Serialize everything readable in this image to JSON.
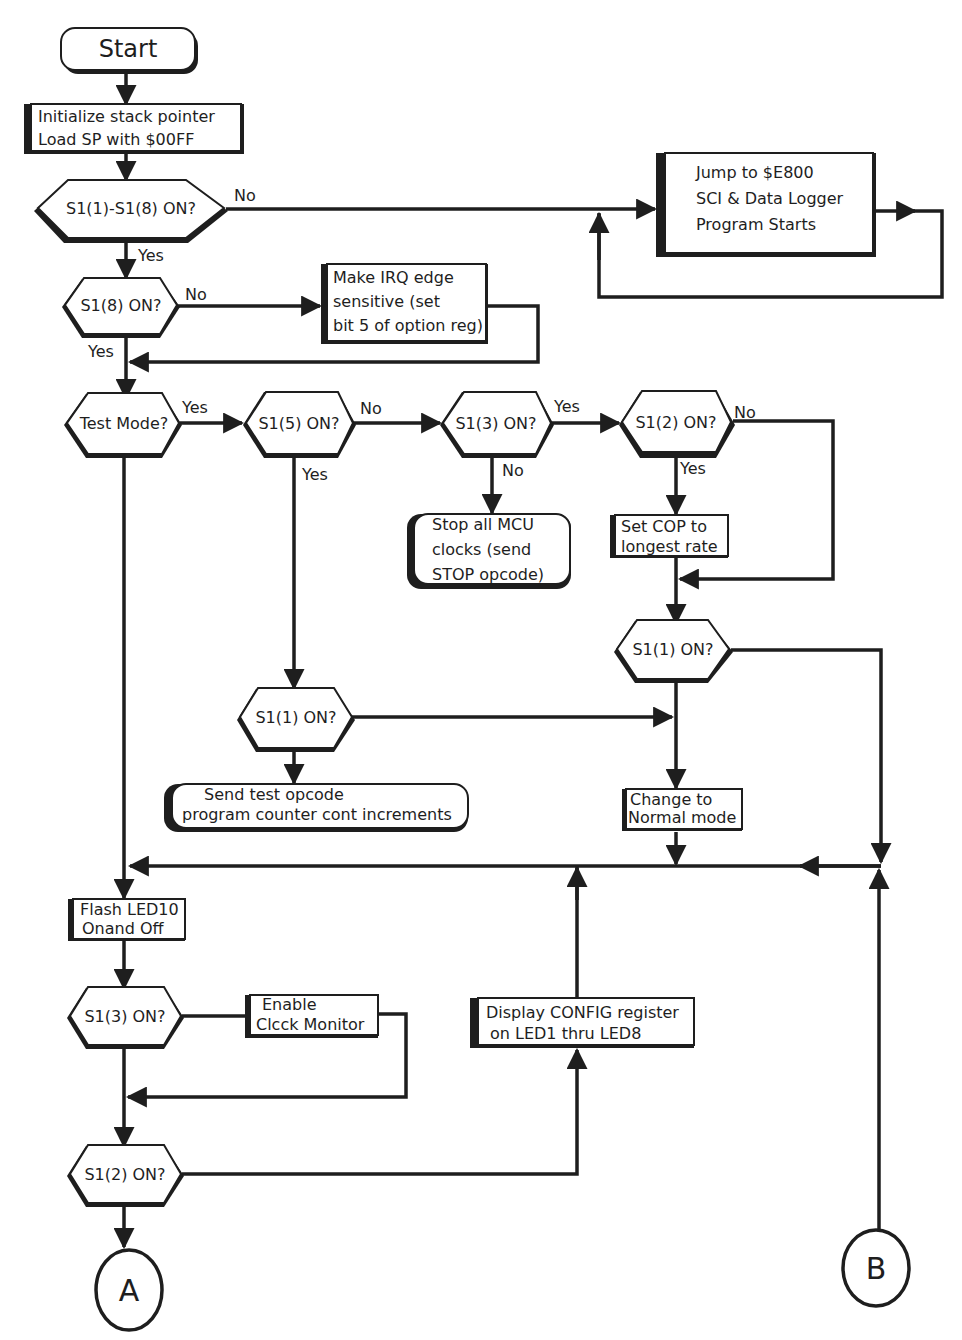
{
  "diagram": {
    "type": "flowchart",
    "colors": {
      "ink": "#1e1e1e",
      "background": "#ffffff"
    },
    "nodes": {
      "start": {
        "kind": "terminal",
        "label": "Start"
      },
      "init_sp": {
        "kind": "process",
        "lines": [
          "Initialize stack pointer",
          "Load SP with $00FF"
        ]
      },
      "dec_all": {
        "kind": "decision",
        "label": "S1(1)-S1(8) ON?"
      },
      "jump_e800": {
        "kind": "process",
        "lines": [
          "Jump to $E800",
          "SCI & Data Logger",
          "Program Starts"
        ]
      },
      "dec_s18": {
        "kind": "decision",
        "label": "S1(8) ON?"
      },
      "irq_edge": {
        "kind": "process",
        "lines": [
          "Make IRQ edge",
          "sensitive (set",
          "bit 5 of option reg)"
        ]
      },
      "dec_test": {
        "kind": "decision",
        "label": "Test Mode?"
      },
      "dec_s15": {
        "kind": "decision",
        "label": "S1(5) ON?"
      },
      "dec_s13a": {
        "kind": "decision",
        "label": "S1(3) ON?"
      },
      "stop_clocks": {
        "kind": "rounded",
        "lines": [
          "Stop all MCU",
          "clocks (send",
          "STOP opcode)"
        ]
      },
      "dec_s12a": {
        "kind": "decision",
        "label": "S1(2) ON?"
      },
      "set_cop": {
        "kind": "process",
        "lines": [
          "Set COP to",
          "longest rate"
        ]
      },
      "dec_s11a": {
        "kind": "decision",
        "label": "S1(1) ON?"
      },
      "dec_s11b": {
        "kind": "decision",
        "label": "S1(1) ON?"
      },
      "send_test": {
        "kind": "rounded",
        "lines": [
          "Send test opcode",
          "program counter cont increments"
        ]
      },
      "normal_mode": {
        "kind": "process",
        "lines": [
          "Change to",
          "Normal mode"
        ]
      },
      "flash_led": {
        "kind": "process",
        "lines": [
          "Flash LED10",
          "Onand Off"
        ]
      },
      "dec_s13b": {
        "kind": "decision",
        "label": "S1(3) ON?"
      },
      "clock_mon": {
        "kind": "process",
        "lines": [
          "Enable",
          "Clcck Monitor"
        ]
      },
      "display_cfg": {
        "kind": "process",
        "lines": [
          "Display CONFIG register",
          "on LED1 thru LED8"
        ]
      },
      "dec_s12b": {
        "kind": "decision",
        "label": "S1(2) ON?"
      },
      "conn_a": {
        "kind": "connector",
        "label": "A"
      },
      "conn_b": {
        "kind": "connector",
        "label": "B"
      }
    },
    "edge_labels": {
      "all_no": "No",
      "all_yes": "Yes",
      "s18_no": "No",
      "s18_yes": "Yes",
      "test_yes": "Yes",
      "s15_no": "No",
      "s15_yes": "Yes",
      "s13_yes": "Yes",
      "s13_no": "No",
      "s12_no": "No",
      "s12_yes": "Yes"
    }
  }
}
